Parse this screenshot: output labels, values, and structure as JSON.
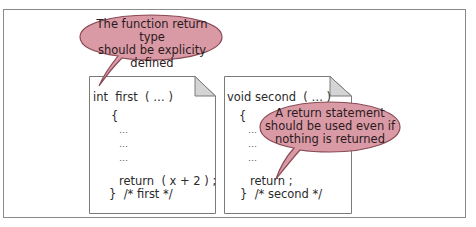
{
  "colors": {
    "frame_border": "#8a8a8a",
    "page_border": "#7a7a7a",
    "fold_fill": "#d4d4d4",
    "bubble_fill": "#d99aa6",
    "bubble_stroke": "#8a4a55"
  },
  "left_page": {
    "header": "int  first  ( … )",
    "open_brace": "{",
    "ellipsis_lines": [
      "…",
      "…",
      "…"
    ],
    "return_line": "return  ( x + 2 ) ;",
    "close_line": "}  /* first */"
  },
  "right_page": {
    "header": "void second  ( … )",
    "open_brace": "{",
    "ellipsis_lines": [
      "…",
      "…",
      "…"
    ],
    "return_line": "return ;",
    "close_line": "}  /* second */"
  },
  "callouts": {
    "left": {
      "lines": [
        "The function return type",
        "should be explicity",
        "defined"
      ]
    },
    "right": {
      "lines": [
        "A return statement",
        "should be used even if",
        "nothing is returned"
      ]
    }
  }
}
